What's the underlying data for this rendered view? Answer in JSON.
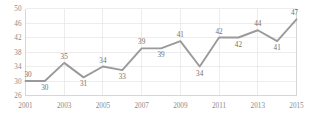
{
  "chart_data": {
    "type": "line",
    "title": "",
    "subtitle": "",
    "xlabel": "",
    "ylabel": "",
    "x": [
      2001,
      2002,
      2003,
      2004,
      2005,
      2006,
      2007,
      2008,
      2009,
      2010,
      2011,
      2012,
      2013,
      2014,
      2015
    ],
    "values": [
      30,
      30,
      35,
      31,
      34,
      33,
      39,
      39,
      41,
      34,
      42,
      42,
      44,
      41,
      47
    ],
    "point_labels": [
      "30",
      "30",
      "35",
      "31",
      "34",
      "33",
      "39",
      "39",
      "41",
      "34",
      "42",
      "42",
      "44",
      "41",
      "47"
    ],
    "point_label_positions": [
      "above",
      "below",
      "above",
      "below",
      "above",
      "below",
      "above",
      "below",
      "above",
      "below",
      "above",
      "below",
      "above",
      "below",
      "above"
    ],
    "series": [
      {
        "name": "",
        "values": [
          30,
          30,
          35,
          31,
          34,
          33,
          39,
          39,
          41,
          34,
          42,
          42,
          44,
          41,
          47
        ],
        "color": "#9a9a9a"
      }
    ],
    "ylim": [
      26,
      50
    ],
    "yticks": [
      26,
      30,
      34,
      38,
      42,
      46,
      50
    ],
    "ytick_labels": [
      "26",
      "30",
      "34",
      "38",
      "42",
      "46",
      "50"
    ],
    "xlim": [
      2001,
      2015
    ],
    "xticks": [
      2001,
      2003,
      2005,
      2007,
      2009,
      2011,
      2013,
      2015
    ],
    "xtick_labels": [
      "2001",
      "2003",
      "2005",
      "2007",
      "2009",
      "2011",
      "2013",
      "2015"
    ],
    "grid": {
      "horizontal": true,
      "vertical": true,
      "color": "#e6e6e6"
    },
    "legend": {
      "visible": false,
      "position": "none"
    },
    "colors": {
      "line": "#9a9a9a",
      "grid": "#e6e6e6",
      "axis": "#cfcfcf",
      "tick_text": "#8a8a8a",
      "label_text": "#6f6f6f",
      "background": "#ffffff"
    }
  }
}
